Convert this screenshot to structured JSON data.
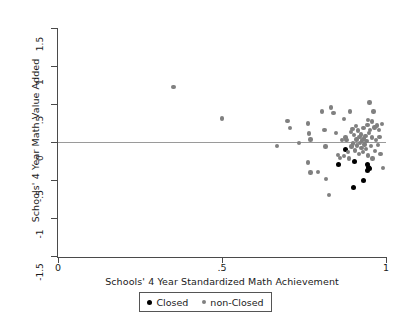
{
  "chart_data": {
    "type": "scatter",
    "title": "",
    "xlabel": "Schools' 4 Year Standardized Math Achievement",
    "ylabel": "Schools' 4 Year Math Value Added",
    "xlim": [
      0,
      1
    ],
    "ylim": [
      -1.5,
      1.5
    ],
    "xticks": [
      "0",
      ".5",
      "1"
    ],
    "xtick_values": [
      0,
      0.5,
      1
    ],
    "yticks": [
      "1.5",
      "1",
      ".5",
      "0",
      "-.5",
      "-1",
      "-1.5"
    ],
    "ytick_values": [
      1.5,
      1,
      0.5,
      0,
      -0.5,
      -1,
      -1.5
    ],
    "grid": false,
    "reference_line": {
      "orientation": "horizontal",
      "y": 0,
      "color": "#9a9a9a"
    },
    "legend_position": "below-axis",
    "series": [
      {
        "name": "Closed",
        "color": "#000000",
        "marker": "circle",
        "points": [
          [
            0.877,
            -0.095
          ],
          [
            0.855,
            -0.295
          ],
          [
            0.905,
            -0.255
          ],
          [
            0.945,
            -0.3
          ],
          [
            0.947,
            -0.33
          ],
          [
            0.95,
            -0.355
          ],
          [
            0.943,
            -0.37
          ],
          [
            0.901,
            -0.595
          ],
          [
            0.93,
            -0.505
          ]
        ]
      },
      {
        "name": "non-Closed",
        "color": "#808080",
        "marker": "circle",
        "points": [
          [
            0.352,
            0.72
          ],
          [
            0.5,
            0.31
          ],
          [
            0.668,
            -0.05
          ],
          [
            0.7,
            0.275
          ],
          [
            0.707,
            0.185
          ],
          [
            0.735,
            -0.015
          ],
          [
            0.762,
            0.245
          ],
          [
            0.765,
            0.11
          ],
          [
            0.77,
            0.035
          ],
          [
            0.763,
            -0.27
          ],
          [
            0.77,
            -0.4
          ],
          [
            0.793,
            -0.395
          ],
          [
            0.805,
            0.4
          ],
          [
            0.812,
            0.155
          ],
          [
            0.815,
            -0.06
          ],
          [
            0.818,
            -0.49
          ],
          [
            0.826,
            -0.695
          ],
          [
            0.832,
            0.455
          ],
          [
            0.84,
            0.38
          ],
          [
            0.848,
            0.115
          ],
          [
            0.853,
            -0.175
          ],
          [
            0.86,
            -0.21
          ],
          [
            0.866,
            0.03
          ],
          [
            0.872,
            -0.185
          ],
          [
            0.876,
            0.06
          ],
          [
            0.88,
            0.025
          ],
          [
            0.884,
            -0.13
          ],
          [
            0.888,
            -0.215
          ],
          [
            0.89,
            0.4
          ],
          [
            0.893,
            0.13
          ],
          [
            0.895,
            -0.06
          ],
          [
            0.898,
            0.175
          ],
          [
            0.9,
            -0.02
          ],
          [
            0.903,
            0.09
          ],
          [
            0.905,
            -0.11
          ],
          [
            0.908,
            0.21
          ],
          [
            0.91,
            0.035
          ],
          [
            0.912,
            -0.045
          ],
          [
            0.915,
            0.15
          ],
          [
            0.917,
            -0.16
          ],
          [
            0.919,
            0.065
          ],
          [
            0.921,
            -0.01
          ],
          [
            0.923,
            0.1
          ],
          [
            0.925,
            -0.075
          ],
          [
            0.927,
            0.02
          ],
          [
            0.929,
            -0.13
          ],
          [
            0.931,
            0.185
          ],
          [
            0.933,
            0.045
          ],
          [
            0.935,
            -0.035
          ],
          [
            0.937,
            0.075
          ],
          [
            0.939,
            -0.095
          ],
          [
            0.941,
            0.01
          ],
          [
            0.944,
            0.225
          ],
          [
            0.946,
            -0.18
          ],
          [
            0.948,
            0.12
          ],
          [
            0.95,
            0.52
          ],
          [
            0.952,
            0.155
          ],
          [
            0.955,
            -0.055
          ],
          [
            0.957,
            0.06
          ],
          [
            0.959,
            -0.215
          ],
          [
            0.962,
            0.4
          ],
          [
            0.965,
            0.19
          ],
          [
            0.967,
            -0.12
          ],
          [
            0.97,
            0.025
          ],
          [
            0.972,
            0.215
          ],
          [
            0.975,
            -0.04
          ],
          [
            0.978,
            0.155
          ],
          [
            0.98,
            0.065
          ],
          [
            0.983,
            -0.155
          ],
          [
            0.987,
            0.24
          ],
          [
            0.99,
            -0.345
          ],
          [
            0.872,
            0.3
          ],
          [
            0.945,
            0.29
          ],
          [
            0.958,
            0.27
          ]
        ]
      }
    ]
  },
  "legend": {
    "entries": [
      {
        "label": "Closed",
        "color": "#000000"
      },
      {
        "label": "non-Closed",
        "color": "#808080"
      }
    ]
  }
}
